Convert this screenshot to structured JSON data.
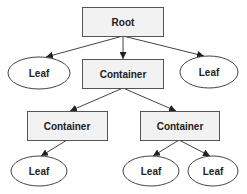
{
  "diagram": {
    "type": "tree",
    "nodes": [
      {
        "id": "root",
        "label": "Root",
        "shape": "rect",
        "x": 82,
        "y": 7,
        "w": 81,
        "h": 29
      },
      {
        "id": "leaf1",
        "label": "Leaf",
        "shape": "ellipse",
        "cx": 39,
        "cy": 73,
        "rx": 31,
        "ry": 16
      },
      {
        "id": "container1",
        "label": "Container",
        "shape": "rect",
        "x": 82,
        "y": 59,
        "w": 81,
        "h": 29
      },
      {
        "id": "leaf2",
        "label": "Leaf",
        "shape": "ellipse",
        "cx": 209,
        "cy": 72,
        "rx": 29,
        "ry": 16
      },
      {
        "id": "container2",
        "label": "Container",
        "shape": "rect",
        "x": 27,
        "y": 111,
        "w": 80,
        "h": 29
      },
      {
        "id": "container3",
        "label": "Container",
        "shape": "rect",
        "x": 140,
        "y": 111,
        "w": 79,
        "h": 29
      },
      {
        "id": "leaf3",
        "label": "Leaf",
        "shape": "ellipse",
        "cx": 39,
        "cy": 171,
        "rx": 28,
        "ry": 15
      },
      {
        "id": "leaf4",
        "label": "Leaf",
        "shape": "ellipse",
        "cx": 151,
        "cy": 171,
        "rx": 28,
        "ry": 15
      },
      {
        "id": "leaf5",
        "label": "Leaf",
        "shape": "ellipse",
        "cx": 213,
        "cy": 171,
        "rx": 25,
        "ry": 15
      }
    ],
    "edges": [
      {
        "from": "root",
        "to": "leaf1"
      },
      {
        "from": "root",
        "to": "container1"
      },
      {
        "from": "root",
        "to": "leaf2"
      },
      {
        "from": "container1",
        "to": "container2"
      },
      {
        "from": "container1",
        "to": "container3"
      },
      {
        "from": "container2",
        "to": "leaf3"
      },
      {
        "from": "container3",
        "to": "leaf4"
      },
      {
        "from": "container3",
        "to": "leaf5"
      }
    ],
    "labels": {
      "root": "Root",
      "leaf1": "Leaf",
      "container1": "Container",
      "leaf2": "Leaf",
      "container2": "Container",
      "container3": "Container",
      "leaf3": "Leaf",
      "leaf4": "Leaf",
      "leaf5": "Leaf"
    },
    "colors": {
      "box_fill": "#f2f2f2",
      "stroke": "#444444",
      "text": "#222222"
    }
  }
}
